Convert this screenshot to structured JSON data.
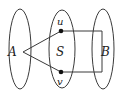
{
  "diagram": {
    "sets": [
      {
        "id": "A",
        "label": "A",
        "cx": 20,
        "cy": 49,
        "rx": 11,
        "ry": 40
      },
      {
        "id": "S",
        "label": "S",
        "cx": 62,
        "cy": 49,
        "rx": 13,
        "ry": 39
      },
      {
        "id": "B",
        "label": "B",
        "cx": 103,
        "cy": 49,
        "rx": 11,
        "ry": 40
      }
    ],
    "vertices": [
      {
        "id": "u",
        "label": "u",
        "x": 61,
        "y": 31
      },
      {
        "id": "v",
        "label": "v",
        "x": 61,
        "y": 72
      }
    ],
    "edges": [
      {
        "from": "A",
        "to": "u"
      },
      {
        "from": "A",
        "to": "v"
      },
      {
        "from": "u",
        "to": "B"
      },
      {
        "from": "B",
        "to": "v"
      }
    ],
    "labels": {
      "A": "A",
      "S": "S",
      "B": "B",
      "u": "u",
      "v": "v"
    },
    "colors": {
      "stroke": "#3a3a3a",
      "point": "#111111",
      "background": "#ffffff"
    }
  }
}
